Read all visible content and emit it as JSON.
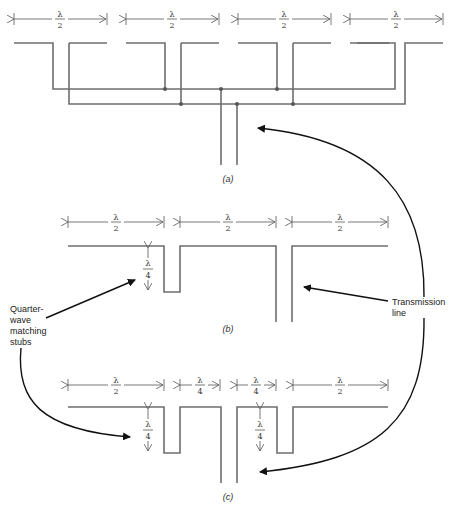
{
  "figure": {
    "panels": [
      {
        "id": "a",
        "caption": "(a)",
        "dimension_labels": [
          {
            "num": "λ",
            "den": "2"
          },
          {
            "num": "λ",
            "den": "2"
          },
          {
            "num": "λ",
            "den": "2"
          },
          {
            "num": "λ",
            "den": "2"
          }
        ]
      },
      {
        "id": "b",
        "caption": "(b)",
        "dimension_labels": [
          {
            "num": "λ",
            "den": "2"
          },
          {
            "num": "λ",
            "den": "2"
          },
          {
            "num": "λ",
            "den": "2"
          }
        ],
        "stub_label": {
          "num": "λ",
          "den": "4"
        }
      },
      {
        "id": "c",
        "caption": "(c)",
        "dimension_labels": [
          {
            "num": "λ",
            "den": "2"
          },
          {
            "num": "λ",
            "den": "4"
          },
          {
            "num": "λ",
            "den": "4"
          },
          {
            "num": "λ",
            "den": "2"
          }
        ],
        "stub_labels": [
          {
            "num": "λ",
            "den": "4"
          },
          {
            "num": "λ",
            "den": "4"
          }
        ]
      }
    ],
    "callouts": {
      "stubs": [
        "Quarter-",
        "wave",
        "matching",
        "stubs"
      ],
      "transmission_line": [
        "Transmission",
        "line"
      ]
    },
    "colors": {
      "element": "#6e6e6e",
      "pointer": "#111111",
      "dimension": "#555555"
    }
  }
}
